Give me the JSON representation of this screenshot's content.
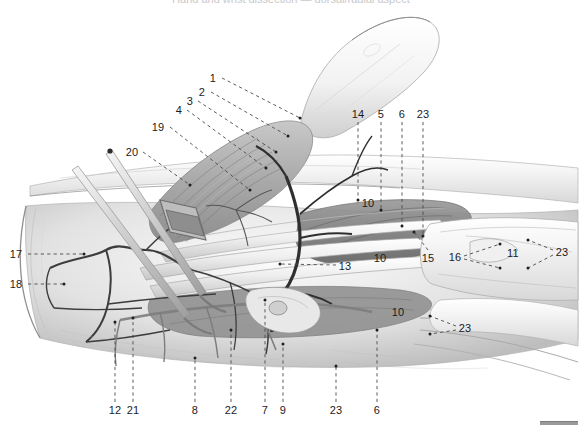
{
  "figure": {
    "title_strip": "Hand and wrist dissection — dorsal/radial aspect",
    "kind": "anatomical-illustration",
    "medium": "grayscale pencil / wash drawing",
    "background_color": "#ffffff",
    "ink_color": "#1b1b1b",
    "leader_color": "#4a4a4a",
    "scale_bar": {
      "name": "scale-bar",
      "color": "#9a9a9a"
    }
  },
  "labels": [
    {
      "id": "l1",
      "text": "1",
      "x": 213,
      "y": 78,
      "leader": {
        "type": "dashed-line",
        "x2": 300,
        "y2": 118
      }
    },
    {
      "id": "l2",
      "text": "2",
      "x": 202,
      "y": 92,
      "leader": {
        "type": "dashed-line",
        "x2": 288,
        "y2": 136
      }
    },
    {
      "id": "l3",
      "text": "3",
      "x": 190,
      "y": 101,
      "leader": {
        "type": "dashed-line",
        "x2": 276,
        "y2": 152
      }
    },
    {
      "id": "l4",
      "text": "4",
      "x": 179,
      "y": 110,
      "leader": {
        "type": "dashed-line",
        "x2": 266,
        "y2": 168
      }
    },
    {
      "id": "l19",
      "text": "19",
      "x": 158,
      "y": 127,
      "leader": {
        "type": "dashed-line",
        "x2": 250,
        "y2": 190
      }
    },
    {
      "id": "l20",
      "text": "20",
      "x": 132,
      "y": 152,
      "leader": {
        "type": "dashed-line",
        "x2": 190,
        "y2": 185
      }
    },
    {
      "id": "l14",
      "text": "14",
      "x": 358,
      "y": 114,
      "leader": {
        "type": "dashed-vline",
        "y2": 200
      }
    },
    {
      "id": "l5",
      "text": "5",
      "x": 381,
      "y": 114,
      "leader": {
        "type": "dashed-vline",
        "y2": 210
      }
    },
    {
      "id": "l6t",
      "text": "6",
      "x": 402,
      "y": 114,
      "leader": {
        "type": "dashed-vline",
        "y2": 226
      }
    },
    {
      "id": "l23t",
      "text": "23",
      "x": 423,
      "y": 114,
      "leader": {
        "type": "dashed-vline",
        "y2": 235
      }
    },
    {
      "id": "l17",
      "text": "17",
      "x": 16,
      "y": 254,
      "leader": {
        "type": "dashed-line",
        "x2": 82,
        "y2": 254
      }
    },
    {
      "id": "l18",
      "text": "18",
      "x": 16,
      "y": 284,
      "leader": {
        "type": "dashed-line",
        "x2": 62,
        "y2": 284
      }
    },
    {
      "id": "l13",
      "text": "13",
      "x": 345,
      "y": 266,
      "leader": {
        "type": "dashed-line",
        "x2": 279,
        "y2": 264
      }
    },
    {
      "id": "l10a",
      "text": "10",
      "x": 368,
      "y": 203,
      "leader": {
        "type": "none"
      }
    },
    {
      "id": "l10b",
      "text": "10",
      "x": 380,
      "y": 258,
      "leader": {
        "type": "none"
      }
    },
    {
      "id": "l15",
      "text": "15",
      "x": 428,
      "y": 258,
      "leader": {
        "type": "dashed-line",
        "x2": 414,
        "y2": 232
      }
    },
    {
      "id": "l16",
      "text": "16",
      "x": 455,
      "y": 257,
      "leader": {
        "type": "dashed-fork",
        "x2": 500,
        "y2": 243
      }
    },
    {
      "id": "l11",
      "text": "11",
      "x": 513,
      "y": 253,
      "leader": {
        "type": "none"
      }
    },
    {
      "id": "l23r",
      "text": "23",
      "x": 562,
      "y": 252,
      "leader": {
        "type": "dashed-fork-left",
        "x2": 528,
        "y2": 240
      }
    },
    {
      "id": "l10c",
      "text": "10",
      "x": 398,
      "y": 312,
      "leader": {
        "type": "none"
      }
    },
    {
      "id": "l23m",
      "text": "23",
      "x": 465,
      "y": 328,
      "leader": {
        "type": "dashed-fork-left",
        "x2": 428,
        "y2": 318
      }
    },
    {
      "id": "l12",
      "text": "12",
      "x": 115,
      "y": 410,
      "leader": {
        "type": "dashed-vline-up",
        "y2": 322
      }
    },
    {
      "id": "l21",
      "text": "21",
      "x": 133,
      "y": 410,
      "leader": {
        "type": "dashed-vline-up",
        "y2": 318
      }
    },
    {
      "id": "l8",
      "text": "8",
      "x": 195,
      "y": 410,
      "leader": {
        "type": "dashed-vline-up",
        "y2": 358
      }
    },
    {
      "id": "l22",
      "text": "22",
      "x": 231,
      "y": 410,
      "leader": {
        "type": "dashed-vline-up",
        "y2": 330
      }
    },
    {
      "id": "l7",
      "text": "7",
      "x": 265,
      "y": 410,
      "leader": {
        "type": "dashed-vline-up",
        "y2": 300
      }
    },
    {
      "id": "l9",
      "text": "9",
      "x": 283,
      "y": 410,
      "leader": {
        "type": "dashed-vline-up",
        "y2": 344
      }
    },
    {
      "id": "l23b",
      "text": "23",
      "x": 336,
      "y": 410,
      "leader": {
        "type": "dashed-vline-up",
        "y2": 366
      }
    },
    {
      "id": "l6b",
      "text": "6",
      "x": 377,
      "y": 410,
      "leader": {
        "type": "dashed-vline-up",
        "y2": 330
      }
    }
  ]
}
